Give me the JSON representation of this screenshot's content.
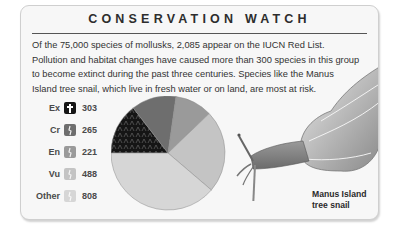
{
  "header": {
    "title": "CONSERVATION WATCH"
  },
  "intro": {
    "lines": [
      "Of the 75,000 species of mollusks, 2,085 appear on the IUCN Red List.",
      "Pollution and habitat changes have caused more than 300 species in this group",
      "to become extinct during the past three centuries. Species like the Manus",
      "Island tree snail, which live in fresh water or on land, are most at risk."
    ]
  },
  "legend": [
    {
      "label": "Ex",
      "value": "303",
      "icon": "extinct-cross-icon",
      "color": "#151515"
    },
    {
      "label": "Cr",
      "value": "265",
      "icon": "critically-endangered-icon",
      "color": "#6e6e6e"
    },
    {
      "label": "En",
      "value": "221",
      "icon": "endangered-icon",
      "color": "#9a9a9a"
    },
    {
      "label": "Vu",
      "value": "488",
      "icon": "vulnerable-icon",
      "color": "#c4c4c4"
    },
    {
      "label": "Other",
      "value": "808",
      "icon": "other-icon",
      "color": "#d6d6d6"
    }
  ],
  "illustration": {
    "caption_line1": "Manus Island",
    "caption_line2": "tree snail"
  },
  "chart_data": {
    "type": "pie",
    "categories": [
      "Ex",
      "Cr",
      "En",
      "Vu",
      "Other"
    ],
    "values": [
      303,
      265,
      221,
      488,
      808
    ],
    "total": 2085,
    "colors": [
      "#151515",
      "#6e6e6e",
      "#9a9a9a",
      "#c4c4c4",
      "#d6d6d6"
    ],
    "legend_position": "left",
    "start_angle_deg": 180,
    "direction": "clockwise"
  }
}
